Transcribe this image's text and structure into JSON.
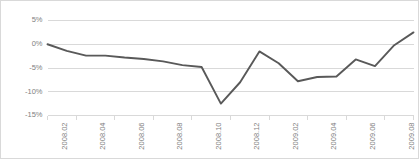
{
  "chart_data": {
    "type": "line",
    "title": "",
    "subtitle": "",
    "xlabel": "",
    "ylabel": "",
    "grid": "horizontal",
    "legend": "none",
    "x": [
      "2008.01",
      "2008.02",
      "2008.03",
      "2008.04",
      "2008.05",
      "2008.06",
      "2008.07",
      "2008.08",
      "2008.09",
      "2008.10",
      "2008.11",
      "2008.12",
      "2009.01",
      "2009.02",
      "2009.03",
      "2009.04",
      "2009.05",
      "2009.06",
      "2009.07",
      "2009.08"
    ],
    "xtick_labels": [
      "2008.02",
      "2008.04",
      "2008.06",
      "2008.08",
      "2008.10",
      "2008.12",
      "2009.02",
      "2009.04",
      "2009.06",
      "2009.08"
    ],
    "ytick_labels": [
      "5%",
      "0%",
      "-5%",
      "-10%",
      "-15%"
    ],
    "ytick_values": [
      5,
      0,
      -5,
      -10,
      -15
    ],
    "ylim": [
      -15,
      5
    ],
    "yunit": "%",
    "series": [
      {
        "name": "growth-rate",
        "color": "#595959",
        "values": [
          0.0,
          -1.4,
          -2.4,
          -2.4,
          -2.8,
          -3.1,
          -3.6,
          -4.4,
          -4.8,
          -12.5,
          -8.0,
          -1.5,
          -4.0,
          -7.8,
          -6.9,
          -6.8,
          -3.2,
          -4.6,
          -0.2,
          2.5
        ]
      }
    ]
  }
}
